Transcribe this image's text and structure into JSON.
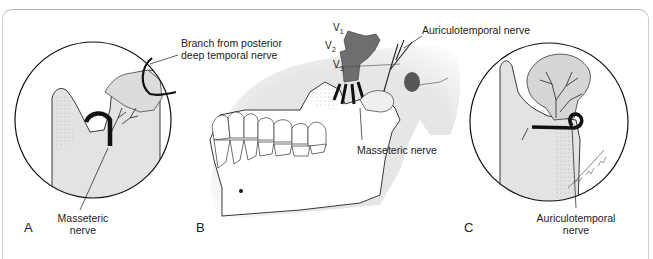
{
  "figure": {
    "panels": [
      {
        "id": "A",
        "letter": "A",
        "description": "Close-up of mandibular notch and condyle showing masseteric nerve and branch from posterior deep temporal nerve"
      },
      {
        "id": "B",
        "letter": "B",
        "description": "Lateral view of mandible and skull base showing trigeminal divisions"
      },
      {
        "id": "C",
        "letter": "C",
        "description": "Close-up of condyle showing auriculotemporal nerve"
      }
    ],
    "labels": {
      "branch_line1": "Branch from posterior",
      "branch_line2": "deep temporal nerve",
      "masseteric_a_line1": "Masseteric",
      "masseteric_a_line2": "nerve",
      "auriculotemporal_b": "Auriculotemporal nerve",
      "masseteric_b": "Masseteric nerve",
      "auriculotemporal_c_line1": "Auriculotemporal",
      "auriculotemporal_c_line2": "nerve",
      "v1": "V",
      "v1_sub": "1",
      "v2": "V",
      "v2_sub": "2",
      "v3": "V",
      "v3_sub": "3"
    },
    "colors": {
      "bone_fill": "#e3e3e3",
      "nerve_dark": "#111111",
      "trigeminal_fill": "#6e6e6e",
      "frame_line": "#b9b9b9"
    }
  }
}
